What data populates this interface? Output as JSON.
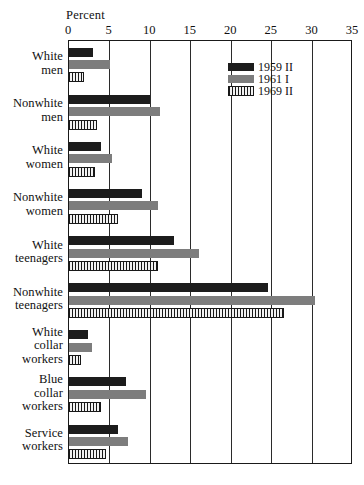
{
  "chart_data": {
    "type": "bar",
    "orientation": "horizontal",
    "title": "",
    "xlabel": "Percent",
    "ylabel": "",
    "xlim": [
      0,
      35
    ],
    "xticks": [
      0,
      5,
      10,
      15,
      20,
      25,
      30,
      35
    ],
    "xticklabels": [
      "0",
      "5",
      "10",
      "15",
      "20",
      "25",
      "30",
      "35"
    ],
    "grid": "vertical",
    "legend_position": "upper right inside",
    "categories": [
      "White men",
      "Nonwhite men",
      "White women",
      "Nonwhite women",
      "White teenagers",
      "Nonwhite teenagers",
      "White collar workers",
      "Blue collar workers",
      "Service workers"
    ],
    "category_lines": [
      [
        "White",
        "men"
      ],
      [
        "Nonwhite",
        "men"
      ],
      [
        "White",
        "women"
      ],
      [
        "Nonwhite",
        "women"
      ],
      [
        "White",
        "teenagers"
      ],
      [
        "Nonwhite",
        "teenagers"
      ],
      [
        "White",
        "collar",
        "workers"
      ],
      [
        "Blue",
        "collar",
        "workers"
      ],
      [
        "Service",
        "workers"
      ]
    ],
    "series": [
      {
        "name": "1959 II",
        "color": "#1c1c1c",
        "pattern": "solid",
        "values": [
          3.0,
          10.0,
          4.0,
          9.0,
          13.0,
          24.5,
          2.3,
          7.0,
          6.0
        ]
      },
      {
        "name": "1961 I",
        "color": "#7d7d7d",
        "pattern": "solid",
        "values": [
          5.0,
          11.2,
          5.3,
          11.0,
          16.0,
          30.3,
          2.8,
          9.5,
          7.3
        ]
      },
      {
        "name": "1969 II",
        "color": "#181818",
        "pattern": "vertical-hatch",
        "values": [
          1.8,
          3.5,
          3.2,
          6.0,
          11.0,
          26.5,
          1.5,
          4.0,
          4.5
        ]
      }
    ]
  },
  "axis": {
    "title": "Percent"
  },
  "legend": {
    "entries": [
      {
        "label": "1959 II"
      },
      {
        "label": "1961 I"
      },
      {
        "label": "1969 II"
      }
    ]
  }
}
